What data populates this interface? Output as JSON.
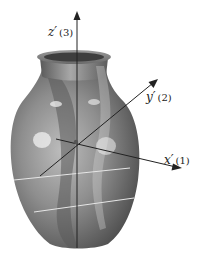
{
  "figure": {
    "axes": [
      {
        "id": "z",
        "symbol": "z′",
        "index": "(3)"
      },
      {
        "id": "y",
        "symbol": "y′",
        "index": "(2)"
      },
      {
        "id": "x",
        "symbol": "x′",
        "index": "(1)"
      }
    ]
  },
  "colors": {
    "axis": "#222222",
    "vase_dark": "#4a4a4a",
    "vase_mid": "#8a8a8a",
    "vase_light": "#c8c8c8",
    "plane_line": "#e0e0e0"
  }
}
